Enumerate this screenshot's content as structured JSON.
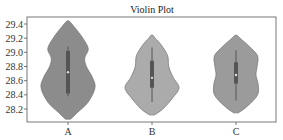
{
  "chart_data": {
    "type": "violin",
    "title": "Violin Plot",
    "xlabel": "",
    "ylabel": "",
    "categories": [
      "A",
      "B",
      "C"
    ],
    "ylim": [
      28.03,
      29.52
    ],
    "yticks": [
      28.2,
      28.4,
      28.6,
      28.8,
      29.0,
      29.2,
      29.4
    ],
    "ytick_labels": [
      "28.2",
      "28.4",
      "28.6",
      "28.8",
      "29.0",
      "29.2",
      "29.4"
    ],
    "grid": false,
    "legend": null,
    "series": [
      {
        "name": "A",
        "min": 28.06,
        "max": 29.44,
        "q1": 28.42,
        "median": 28.72,
        "q3": 29.02,
        "whisker_low": 28.38,
        "whisker_high": 29.08,
        "fill": "#8c8c8c",
        "density_profile": [
          [
            28.06,
            0.1
          ],
          [
            28.15,
            0.35
          ],
          [
            28.3,
            0.75
          ],
          [
            28.5,
            1.0
          ],
          [
            28.65,
            0.9
          ],
          [
            28.8,
            0.68
          ],
          [
            28.92,
            0.62
          ],
          [
            29.05,
            0.75
          ],
          [
            29.2,
            0.55
          ],
          [
            29.35,
            0.25
          ],
          [
            29.44,
            0.05
          ]
        ]
      },
      {
        "name": "B",
        "min": 28.12,
        "max": 29.24,
        "q1": 28.5,
        "median": 28.64,
        "q3": 28.88,
        "whisker_low": 28.3,
        "whisker_high": 29.07,
        "fill": "#ababab",
        "density_profile": [
          [
            28.12,
            0.1
          ],
          [
            28.2,
            0.4
          ],
          [
            28.35,
            0.75
          ],
          [
            28.5,
            1.0
          ],
          [
            28.65,
            0.78
          ],
          [
            28.8,
            0.62
          ],
          [
            28.95,
            0.58
          ],
          [
            29.1,
            0.35
          ],
          [
            29.2,
            0.12
          ],
          [
            29.24,
            0.04
          ]
        ]
      },
      {
        "name": "C",
        "min": 28.15,
        "max": 29.24,
        "q1": 28.56,
        "median": 28.68,
        "q3": 28.86,
        "whisker_low": 28.32,
        "whisker_high": 29.03,
        "fill": "#9b9b9b",
        "density_profile": [
          [
            28.15,
            0.1
          ],
          [
            28.25,
            0.45
          ],
          [
            28.4,
            0.8
          ],
          [
            28.55,
            0.82
          ],
          [
            28.68,
            0.74
          ],
          [
            28.8,
            0.78
          ],
          [
            28.95,
            0.8
          ],
          [
            29.08,
            0.5
          ],
          [
            29.2,
            0.15
          ],
          [
            29.24,
            0.04
          ]
        ]
      }
    ]
  },
  "colors": {
    "axis": "#333333",
    "box": "#555555",
    "outline": "#7a7a7a"
  }
}
